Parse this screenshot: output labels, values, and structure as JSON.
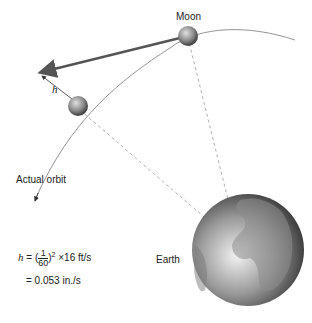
{
  "labels": {
    "moon": "Moon",
    "h": "h",
    "actual_orbit": "Actual orbit",
    "earth": "Earth"
  },
  "formula": {
    "var": "h",
    "eq": " = (",
    "num": "1",
    "den": "60",
    "close": ")",
    "exp": "2",
    "times": " ×16 ft/s",
    "result": "= 0.053 in./s"
  },
  "colors": {
    "arrow": "#555555",
    "orbit": "#888888",
    "dashed": "#999999",
    "sphere": "#777777"
  }
}
